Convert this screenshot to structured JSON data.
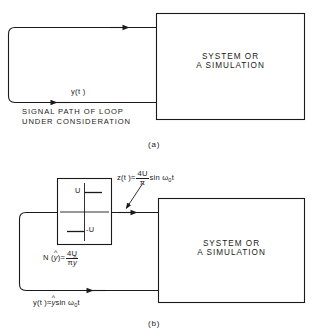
{
  "figure": {
    "title_a_caption": "(a)",
    "title_b_caption": "(b)"
  },
  "panel_a": {
    "system_block": {
      "line1": "SYSTEM OR",
      "line2": "A SIMULATION"
    },
    "feedback_signal_label": "y(t )",
    "path_note_line1": "SIGNAL PATH OF LOOP",
    "path_note_line2": "UNDER CONSIDERATION",
    "caption": "(a)"
  },
  "panel_b": {
    "system_block": {
      "line1": "SYSTEM OR",
      "line2": "A SIMULATION"
    },
    "relay_block": {
      "upper_level_label": "U",
      "lower_level_label": "-U"
    },
    "describing_function": {
      "lhs": "N (",
      "lhs_var": "y",
      "lhs_close": ")=",
      "numerator": "4U",
      "denominator_pi": "π",
      "denominator_var": "y"
    },
    "output_signal": {
      "name": "z(t )",
      "approx": "≈",
      "numerator": "4U",
      "denominator": "π",
      "trig": "sin ω",
      "subscript": "0",
      "time": "t"
    },
    "feedback_signal": {
      "name": "y(t )",
      "approx": "≈",
      "amplitude": "y",
      "trig": "sin ω",
      "subscript": "0",
      "time": "t"
    },
    "caption": "(b)"
  },
  "style": {
    "line_color": "#1a1a1a",
    "background": "#ffffff"
  }
}
